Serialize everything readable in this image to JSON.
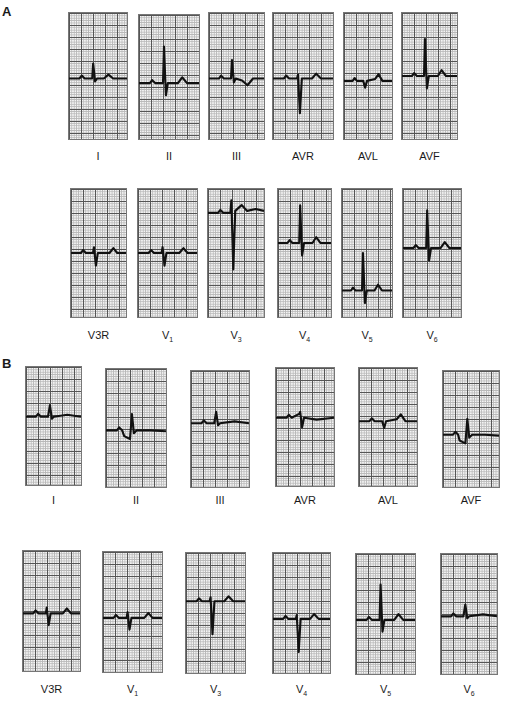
{
  "figure": {
    "panels": [
      {
        "id": "A",
        "label": "A",
        "rows": [
          {
            "leads": [
              {
                "name": "I",
                "sub": "",
                "x": 68,
                "y": 12,
                "w": 60,
                "h": 128,
                "baseline": 0.52,
                "trace": "flat-upright"
              },
              {
                "name": "II",
                "sub": "",
                "x": 138,
                "y": 14,
                "w": 62,
                "h": 126,
                "baseline": 0.55,
                "trace": "tall-r"
              },
              {
                "name": "III",
                "sub": "",
                "x": 208,
                "y": 12,
                "w": 57,
                "h": 128,
                "baseline": 0.52,
                "trace": "inverted-t"
              },
              {
                "name": "AVR",
                "sub": "",
                "x": 272,
                "y": 12,
                "w": 62,
                "h": 128,
                "baseline": 0.52,
                "trace": "deep-s"
              },
              {
                "name": "AVL",
                "sub": "",
                "x": 343,
                "y": 12,
                "w": 50,
                "h": 128,
                "baseline": 0.54,
                "trace": "small-q"
              },
              {
                "name": "AVF",
                "sub": "",
                "x": 401,
                "y": 12,
                "w": 57,
                "h": 128,
                "baseline": 0.5,
                "trace": "tall-r"
              }
            ],
            "label_y": 150
          },
          {
            "leads": [
              {
                "name": "V3R",
                "sub": "",
                "x": 70,
                "y": 188,
                "w": 57,
                "h": 130,
                "baseline": 0.5,
                "trace": "rs"
              },
              {
                "name": "V",
                "sub": "1",
                "x": 137,
                "y": 188,
                "w": 61,
                "h": 130,
                "baseline": 0.5,
                "trace": "rs"
              },
              {
                "name": "V",
                "sub": "3",
                "x": 207,
                "y": 188,
                "w": 58,
                "h": 130,
                "baseline": 0.18,
                "trace": "deep-s-elevated"
              },
              {
                "name": "V",
                "sub": "4",
                "x": 277,
                "y": 188,
                "w": 55,
                "h": 130,
                "baseline": 0.42,
                "trace": "tall-r"
              },
              {
                "name": "V",
                "sub": "5",
                "x": 341,
                "y": 188,
                "w": 52,
                "h": 130,
                "baseline": 0.8,
                "trace": "tall-r"
              },
              {
                "name": "V",
                "sub": "6",
                "x": 402,
                "y": 188,
                "w": 60,
                "h": 130,
                "baseline": 0.46,
                "trace": "tall-r"
              }
            ],
            "label_y": 329
          }
        ]
      },
      {
        "id": "B",
        "label": "B",
        "rows": [
          {
            "leads": [
              {
                "name": "I",
                "sub": "",
                "x": 25,
                "y": 366,
                "w": 57,
                "h": 120,
                "baseline": 0.42,
                "trace": "small-r"
              },
              {
                "name": "II",
                "sub": "",
                "x": 105,
                "y": 368,
                "w": 62,
                "h": 120,
                "baseline": 0.52,
                "trace": "notched"
              },
              {
                "name": "III",
                "sub": "",
                "x": 190,
                "y": 370,
                "w": 60,
                "h": 118,
                "baseline": 0.45,
                "trace": "small-r"
              },
              {
                "name": "AVR",
                "sub": "",
                "x": 275,
                "y": 367,
                "w": 60,
                "h": 120,
                "baseline": 0.42,
                "trace": "qs"
              },
              {
                "name": "AVL",
                "sub": "",
                "x": 358,
                "y": 367,
                "w": 60,
                "h": 120,
                "baseline": 0.45,
                "trace": "small-q"
              },
              {
                "name": "AVF",
                "sub": "",
                "x": 442,
                "y": 370,
                "w": 58,
                "h": 118,
                "baseline": 0.55,
                "trace": "notched"
              }
            ],
            "label_y": 494
          },
          {
            "leads": [
              {
                "name": "V3R",
                "sub": "",
                "x": 22,
                "y": 550,
                "w": 59,
                "h": 122,
                "baseline": 0.52,
                "trace": "rs"
              },
              {
                "name": "V",
                "sub": "1",
                "x": 102,
                "y": 551,
                "w": 61,
                "h": 122,
                "baseline": 0.55,
                "trace": "rs"
              },
              {
                "name": "V",
                "sub": "3",
                "x": 185,
                "y": 552,
                "w": 61,
                "h": 122,
                "baseline": 0.4,
                "trace": "deep-s"
              },
              {
                "name": "V",
                "sub": "4",
                "x": 272,
                "y": 552,
                "w": 59,
                "h": 122,
                "baseline": 0.55,
                "trace": "deep-s"
              },
              {
                "name": "V",
                "sub": "5",
                "x": 355,
                "y": 553,
                "w": 61,
                "h": 122,
                "baseline": 0.55,
                "trace": "tall-r"
              },
              {
                "name": "V",
                "sub": "6",
                "x": 440,
                "y": 553,
                "w": 58,
                "h": 122,
                "baseline": 0.52,
                "trace": "small-r"
              }
            ],
            "label_y": 683
          }
        ]
      }
    ]
  },
  "colors": {
    "trace": "#111111",
    "grid_major": "#555555",
    "grid_minor": "#b8b8b8",
    "paper": "#f4f4f4"
  }
}
